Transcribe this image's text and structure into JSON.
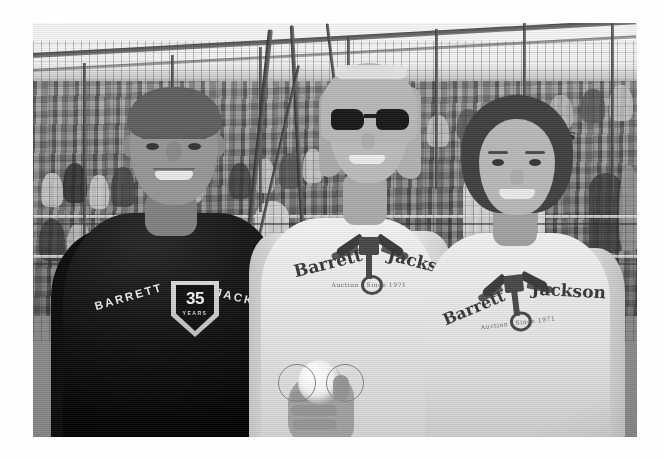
{
  "photo": {
    "kind": "photograph",
    "treatment": "black-and-white",
    "scene": "Three people posing together in the stands at a baseball stadium",
    "frame": {
      "left": 33,
      "top": 23,
      "width": 604,
      "height": 414,
      "page_background": "#ffffff"
    },
    "palette": {
      "sky": "#f1f1f1",
      "crowd_mid": "#7e7e7e",
      "dark_shirt": "#0d0d0d",
      "light_shirt": "#ece9e3",
      "skin": "#c6ac96",
      "hair_blonde": "#c9b694",
      "hair_brunette": "#4f4038",
      "sunglasses": "#1d1d1d",
      "baseball": "#f5f3ee"
    }
  },
  "subjects": [
    {
      "id": "man-left",
      "label": "Man in black t-shirt",
      "shirt_color": "black",
      "shirt_print": {
        "left_word": "BARRETT",
        "right_word": "JACKSON",
        "badge_number": "35",
        "badge_caption": "YEARS"
      }
    },
    {
      "id": "woman-center",
      "label": "Blonde woman wearing sunglasses",
      "shirt_color": "white",
      "accessories": [
        "dark sunglasses",
        "headband"
      ],
      "holding": "baseball",
      "shirt_print": {
        "left_word": "Barrett",
        "right_word": "Jackson",
        "emblem": "winged piston",
        "subline": "Auction  ·  Since 1971"
      }
    },
    {
      "id": "woman-right",
      "label": "Woman with dark wavy hair",
      "shirt_color": "white",
      "shirt_print": {
        "left_word": "Barrett",
        "right_word": "Jackson",
        "emblem": "winged piston",
        "subline": "Auction  ·  Since 1971"
      }
    }
  ],
  "background": {
    "setting": "stadium bleachers",
    "elements": [
      "sky",
      "chain-link backstop fence",
      "netting poles",
      "seated crowd",
      "guard railings"
    ],
    "jersey_text": "als"
  },
  "objects": [
    {
      "name": "baseball",
      "held_by": "woman-center",
      "description": "white baseball with red seams (rendered grey)"
    }
  ]
}
